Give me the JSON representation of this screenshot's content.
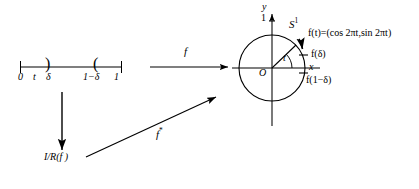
{
  "figure": {
    "background": "#ffffff",
    "ink": "#000000",
    "width": 419,
    "height": 189
  },
  "interval": {
    "name": "unit-interval",
    "ticks": [
      {
        "id": "zero",
        "label": "0",
        "x": 22
      },
      {
        "id": "t",
        "label": "t",
        "x": 36
      },
      {
        "id": "delta",
        "label": "δ",
        "x": 50
      },
      {
        "id": "one-minus-delta",
        "label": "1−δ",
        "x": 92
      },
      {
        "id": "one",
        "label": "1",
        "x": 117
      }
    ],
    "brackets": [
      {
        "id": "open-right-paren",
        "glyph": ")",
        "x": 48
      },
      {
        "id": "open-left-paren",
        "glyph": "(",
        "x": 96
      }
    ],
    "line": {
      "x1": 20,
      "x2": 122,
      "y": 67
    }
  },
  "arrows": {
    "f": {
      "label": "f",
      "label_x": 186,
      "label_y": 48,
      "x1": 150,
      "x2": 226,
      "y": 67
    },
    "quotient": {
      "label": "I/R(f )",
      "label_x": 47,
      "label_y": 155,
      "x": 62,
      "y1": 92,
      "y2": 148
    },
    "f_star": {
      "label": "f",
      "superscript": "*",
      "label_x": 160,
      "label_y": 131,
      "x1": 86,
      "y1": 157,
      "x2": 214,
      "y2": 98
    }
  },
  "circle": {
    "name": "unit-circle",
    "center": {
      "x": 272,
      "y": 68
    },
    "radius": 33,
    "label": "S",
    "label_superscript": "1",
    "label_x": 292,
    "label_y": 22,
    "origin_label": "O",
    "origin_x": 262,
    "origin_y": 70,
    "axes": {
      "x_label": "x",
      "x_label_x": 312,
      "x_label_y": 70,
      "y_label": "y",
      "y_label_x": 265,
      "y_label_y": 6,
      "y_tick_label": "1",
      "y_tick_x": 262,
      "y_tick_y": 20,
      "x_axis": {
        "x1": 232,
        "x2": 320,
        "y": 68
      },
      "y_axis": {
        "x": 272,
        "y1": 12,
        "y2": 126
      }
    },
    "angle_label": "t",
    "angle_label_x": 284,
    "angle_label_y": 57,
    "points": [
      {
        "id": "f-of-t",
        "label": "f(t)=(cos 2πt,sin 2πt)",
        "x": 309,
        "y": 33
      },
      {
        "id": "f-of-delta",
        "label": "f(δ)",
        "x": 315,
        "y": 55
      },
      {
        "id": "f-of-one-minus-delta",
        "label": "f(1−δ)",
        "x": 309,
        "y": 80
      }
    ]
  }
}
